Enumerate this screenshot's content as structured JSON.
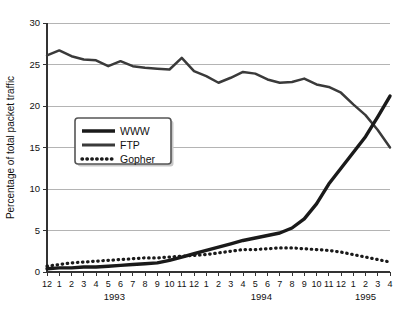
{
  "chart_data": {
    "type": "line",
    "title": "",
    "xlabel": "",
    "ylabel": "Percentage of total packet traffic",
    "ylim": [
      0,
      30
    ],
    "yticks": [
      0,
      5,
      10,
      15,
      20,
      25,
      30
    ],
    "ytick_labels": [
      "0",
      "5",
      "10",
      "15",
      "20",
      "25",
      "30"
    ],
    "grid": true,
    "legend_position": "center-left",
    "x": [
      "12",
      "1",
      "2",
      "3",
      "4",
      "5",
      "6",
      "7",
      "8",
      "9",
      "10",
      "11",
      "12",
      "1",
      "2",
      "3",
      "4",
      "5",
      "6",
      "7",
      "8",
      "9",
      "10",
      "11",
      "12",
      "1",
      "2",
      "3",
      "4"
    ],
    "xtick_labels": [
      "12",
      "1",
      "2",
      "3",
      "4",
      "5",
      "6",
      "7",
      "8",
      "9",
      "10",
      "11",
      "12",
      "1",
      "2",
      "3",
      "4",
      "5",
      "6",
      "7",
      "8",
      "9",
      "10",
      "11",
      "12",
      "1",
      "2",
      "3",
      "4"
    ],
    "year_groups": [
      {
        "label": "1993",
        "start_index": 0,
        "end_index": 11
      },
      {
        "label": "1994",
        "start_index": 12,
        "end_index": 23
      },
      {
        "label": "1995",
        "start_index": 24,
        "end_index": 28
      }
    ],
    "series": [
      {
        "name": "WWW",
        "style": "thick-solid",
        "color": "#1a1a1a",
        "values": [
          0.4,
          0.5,
          0.5,
          0.6,
          0.6,
          0.7,
          0.8,
          0.9,
          1.0,
          1.1,
          1.4,
          1.8,
          2.2,
          2.6,
          3.0,
          3.4,
          3.8,
          4.1,
          4.4,
          4.7,
          5.3,
          6.4,
          8.2,
          10.6,
          12.5,
          14.4,
          16.3,
          18.7,
          21.2
        ]
      },
      {
        "name": "FTP",
        "style": "medium-solid",
        "color": "#3a3a3a",
        "values": [
          26.1,
          26.7,
          26.0,
          25.6,
          25.5,
          24.8,
          25.4,
          24.8,
          24.6,
          24.5,
          24.4,
          25.8,
          24.2,
          23.6,
          22.8,
          23.4,
          24.1,
          23.9,
          23.2,
          22.8,
          22.9,
          23.3,
          22.6,
          22.3,
          21.6,
          20.2,
          18.9,
          17.1,
          15.0
        ]
      },
      {
        "name": "Gopher",
        "style": "dotted",
        "color": "#1a1a1a",
        "values": [
          0.7,
          0.9,
          1.1,
          1.2,
          1.3,
          1.4,
          1.5,
          1.6,
          1.7,
          1.7,
          1.8,
          1.9,
          2.0,
          2.1,
          2.3,
          2.5,
          2.7,
          2.7,
          2.8,
          2.9,
          2.9,
          2.8,
          2.7,
          2.6,
          2.4,
          2.1,
          1.8,
          1.5,
          1.2
        ]
      }
    ]
  },
  "legend": {
    "items": [
      {
        "label": "WWW",
        "style": "thick-solid"
      },
      {
        "label": "FTP",
        "style": "medium-solid"
      },
      {
        "label": "Gopher",
        "style": "dotted"
      }
    ]
  },
  "colors": {
    "line_www": "#1a1a1a",
    "line_ftp": "#3a3a3a",
    "line_gopher": "#1a1a1a",
    "grid": "#b4b4b4",
    "axis": "#333333",
    "background": "#ffffff"
  }
}
